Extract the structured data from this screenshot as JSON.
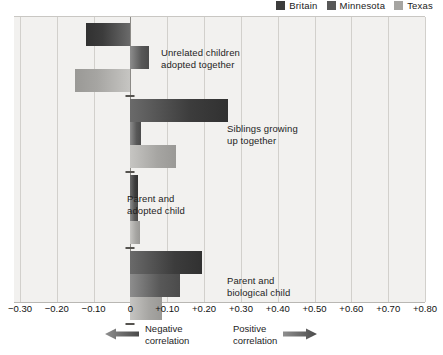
{
  "legend": {
    "entries": [
      {
        "label": "Britain",
        "color": "#3c3c3c",
        "icon": "square-swatch-icon"
      },
      {
        "label": "Minnesota",
        "color": "#585858",
        "icon": "square-swatch-icon"
      },
      {
        "label": "Texas",
        "color": "#a6a5a2",
        "icon": "square-swatch-icon"
      }
    ]
  },
  "axis": {
    "tick_labels": [
      "−0.30",
      "−0.20",
      "−0.10",
      "0",
      "+0.10",
      "+0.20",
      "+0.30",
      "+0.40",
      "+0.50",
      "+0.60",
      "+0.70",
      "+0.80"
    ],
    "tick_values": [
      -0.3,
      -0.2,
      -0.1,
      0,
      0.1,
      0.2,
      0.3,
      0.4,
      0.5,
      0.6,
      0.7,
      0.8
    ]
  },
  "footer": {
    "negative_label": "Negative\ncorrelation",
    "positive_label": "Positive\ncorrelation",
    "negative_arrow_icon": "arrow-left-icon",
    "positive_arrow_icon": "arrow-right-icon"
  },
  "group_labels": [
    "Unrelated children\nadopted together",
    "Siblings growing\nup together",
    "Parent and\nadopted child",
    "Parent and\nbiological child"
  ],
  "chart_data": {
    "type": "bar",
    "orientation": "horizontal",
    "title": "",
    "xlabel": "",
    "ylabel": "",
    "xlim": [
      -0.3,
      0.8
    ],
    "xtick_step": 0.1,
    "grid": true,
    "legend_position": "top-right",
    "categories": [
      "Unrelated children adopted together",
      "Siblings growing up together",
      "Parent and adopted child",
      "Parent and biological child"
    ],
    "series": [
      {
        "name": "Britain",
        "color": "#3c3c3c",
        "values": [
          -0.12,
          0.265,
          0.02,
          0.195
        ]
      },
      {
        "name": "Minnesota",
        "color": "#585858",
        "values": [
          0.05,
          0.03,
          0.02,
          0.135
        ]
      },
      {
        "name": "Texas",
        "color": "#a6a5a2",
        "values": [
          -0.15,
          0.125,
          0.025,
          0.085
        ]
      }
    ]
  }
}
